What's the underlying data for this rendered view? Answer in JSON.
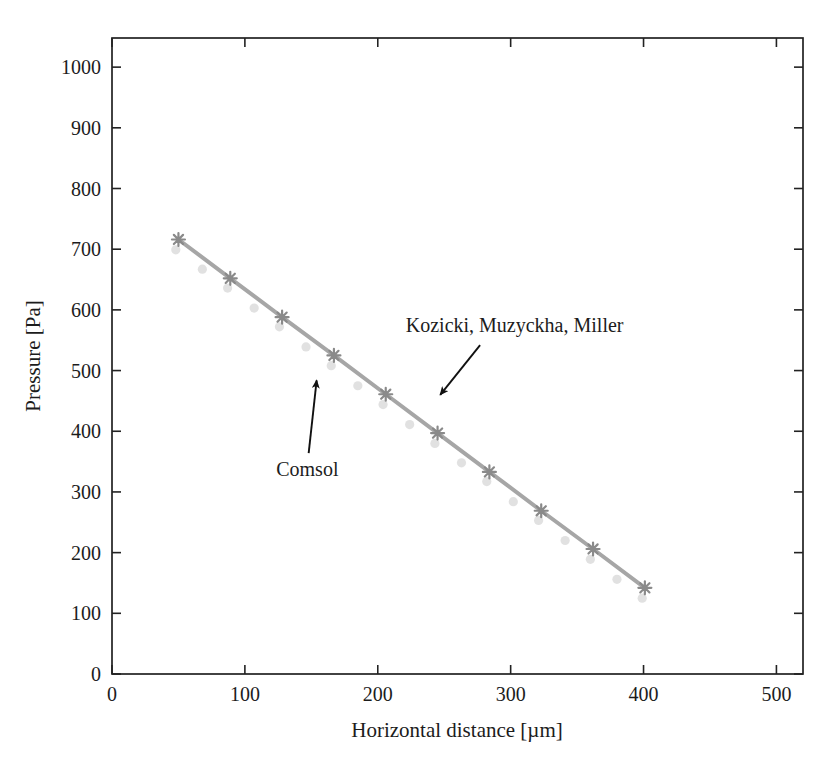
{
  "figure": {
    "background": "#ffffff",
    "axis_color": "#222222",
    "text_color": "#1c1c1c",
    "arrow_color": "#111111"
  },
  "chart_data": {
    "type": "line",
    "title": "",
    "xlabel": "Horizontal distance [µm]",
    "ylabel": "Pressure [Pa]",
    "xlim": [
      0,
      520
    ],
    "ylim": [
      0,
      1048
    ],
    "xticks": [
      0,
      100,
      200,
      300,
      400,
      500
    ],
    "yticks": [
      0,
      100,
      200,
      300,
      400,
      500,
      600,
      700,
      800,
      900,
      1000
    ],
    "grid": false,
    "legend_position": "none (inline arrow annotations)",
    "series": [
      {
        "name": "Kozicki, Muzyckha, Miller",
        "marker": "asterisk",
        "line": true,
        "line_color": "#a6a6a6",
        "marker_color": "#8a8a8a",
        "x": [
          50,
          89,
          128,
          167,
          206,
          245,
          284,
          323,
          362,
          401
        ],
        "y": [
          716,
          652,
          588,
          525,
          461,
          397,
          333,
          269,
          206,
          142
        ]
      },
      {
        "name": "Comsol",
        "marker": "circle",
        "line": false,
        "line_color": "none",
        "marker_color": "#d7d7d7",
        "x": [
          48,
          68,
          87,
          107,
          126,
          146,
          165,
          185,
          204,
          224,
          243,
          263,
          282,
          302,
          321,
          341,
          360,
          380,
          399
        ],
        "y": [
          699,
          667,
          636,
          603,
          572,
          539,
          508,
          475,
          444,
          411,
          380,
          348,
          317,
          284,
          253,
          220,
          189,
          156,
          125
        ]
      }
    ],
    "annotations": [
      {
        "text": "Kozicki, Muzyckha, Miller",
        "text_x": 303,
        "text_y": 575,
        "arrow_from_x": 277,
        "arrow_from_y": 542,
        "arrow_to_x": 247,
        "arrow_to_y": 460
      },
      {
        "text": "Comsol",
        "text_x": 147,
        "text_y": 338,
        "arrow_from_x": 148,
        "arrow_from_y": 364,
        "arrow_to_x": 154,
        "arrow_to_y": 484
      }
    ]
  }
}
